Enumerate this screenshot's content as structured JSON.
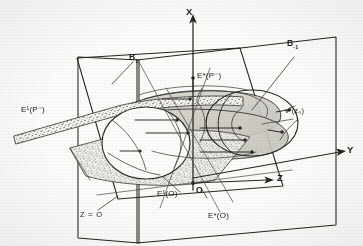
{
  "figure": {
    "kind": "hand-drawn 3d geometric diagram",
    "background_color": "#fbfbfa",
    "ink_color": "#26251f",
    "shade_color": "#cfcdc7",
    "stipple_color": "#4a4843"
  },
  "axes": {
    "x_label": "X",
    "y_label": "Y",
    "z_label": "Z",
    "origin_label": "O"
  },
  "planes": [
    {
      "id": "b1",
      "label": "B",
      "sub": "1",
      "name": "plane-B1"
    },
    {
      "id": "bm1",
      "label": "B",
      "sub": "-1",
      "name": "plane-B-minus-1"
    },
    {
      "id": "z0",
      "label": "Z = O",
      "name": "plane-Z-equals-zero"
    }
  ],
  "sets": [
    {
      "id": "e1p",
      "base": "E",
      "sup": "1",
      "arg": "(P⁻)",
      "text": "E¹(P⁻)"
    },
    {
      "id": "esp",
      "base": "E",
      "sup": "*",
      "arg": "(P⁻)",
      "text": "E*(P⁻)"
    },
    {
      "id": "e1o",
      "base": "E",
      "sup": "1",
      "arg": "(O)",
      "text": "E¹(O)"
    },
    {
      "id": "eso",
      "base": "E",
      "sup": "*",
      "arg": "(O)",
      "text": "E*(O)"
    }
  ],
  "vectors": [
    {
      "id": "vz0",
      "text": "v¹(z₀)",
      "base": "v",
      "sup": "1",
      "arg": "(z₀)"
    }
  ],
  "labels": {
    "x": "X",
    "y": "Y",
    "z": "Z",
    "origin": "O",
    "b1": "B",
    "b1_sub": "1",
    "bm1": "B",
    "bm1_sub": "-1",
    "z_eq_zero": "Z = O",
    "e1_p": "E¹(P⁻)",
    "estar_p": "E*(P⁻)",
    "e1_o": "E¹(O)",
    "estar_o": "E*(O)",
    "v_z0": "v¹(z₀)"
  }
}
